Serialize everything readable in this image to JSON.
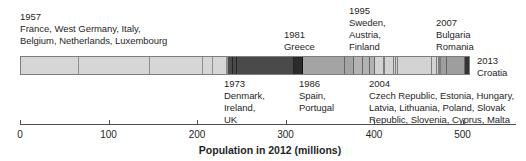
{
  "figure": {
    "background": "#ffffff",
    "text_color": "#1f1f1f",
    "axis_color": "#4d4d4d",
    "bar_border_color": "#7d7d7d"
  },
  "chart_data": {
    "type": "bar",
    "subtype": "stacked-timeline",
    "xlabel": "Population in 2012 (millions)",
    "axis": {
      "min": 0,
      "max": 500,
      "ticks": [
        0,
        100,
        200,
        300,
        400,
        500
      ],
      "unit": "millions",
      "grid": false
    },
    "groups": [
      {
        "year": "1957",
        "label_side": "above",
        "label_lines": [
          "1957",
          "France, West Germany, Italy,",
          "Belgium, Netherlands, Luxembourg"
        ],
        "fill": "#d6d6d6",
        "divider": "#8f8f8f",
        "countries": [
          {
            "name": "France",
            "population": 65.3
          },
          {
            "name": "West Germany",
            "population": 80.4
          },
          {
            "name": "Italy",
            "population": 59.7
          },
          {
            "name": "Belgium",
            "population": 11.1
          },
          {
            "name": "Netherlands",
            "population": 16.8
          },
          {
            "name": "Luxembourg",
            "population": 0.5
          }
        ]
      },
      {
        "year": "1973",
        "label_side": "below",
        "label_lines": [
          "1973",
          "Denmark,",
          "Ireland,",
          "UK"
        ],
        "fill": "#4a4a4a",
        "divider": "#242424",
        "countries": [
          {
            "name": "Denmark",
            "population": 5.6
          },
          {
            "name": "Ireland",
            "population": 4.6
          },
          {
            "name": "UK",
            "population": 63.5
          }
        ]
      },
      {
        "year": "1981",
        "label_side": "above",
        "label_lines": [
          "1981",
          "Greece"
        ],
        "fill": "#2b2b2b",
        "divider": "#111111",
        "countries": [
          {
            "name": "Greece",
            "population": 11.1
          }
        ]
      },
      {
        "year": "1986",
        "label_side": "below",
        "label_lines": [
          "1986",
          "Spain,",
          "Portugal"
        ],
        "fill": "#a4a4a4",
        "divider": "#666666",
        "countries": [
          {
            "name": "Spain",
            "population": 46.8
          },
          {
            "name": "Portugal",
            "population": 10.5
          }
        ]
      },
      {
        "year": "1995",
        "label_side": "above",
        "label_lines": [
          "1995",
          "Sweden,",
          "Austria,",
          "Finland"
        ],
        "fill": "#b2b2b2",
        "divider": "#666666",
        "countries": [
          {
            "name": "Sweden",
            "population": 9.5
          },
          {
            "name": "Austria",
            "population": 8.4
          },
          {
            "name": "Finland",
            "population": 5.4
          }
        ]
      },
      {
        "year": "2004",
        "label_side": "below",
        "label_lines": [
          "2004",
          "Czech Republic, Estonia, Hungary,",
          "Latvia, Lithuania, Poland, Slovak",
          "Republic, Slovenia, Cyprus, Malta"
        ],
        "fill": "#d3d3d3",
        "divider": "#7d7d7d",
        "countries": [
          {
            "name": "Czech Republic",
            "population": 10.5
          },
          {
            "name": "Estonia",
            "population": 1.3
          },
          {
            "name": "Hungary",
            "population": 9.9
          },
          {
            "name": "Latvia",
            "population": 2.0
          },
          {
            "name": "Lithuania",
            "population": 3.0
          },
          {
            "name": "Poland",
            "population": 38.5
          },
          {
            "name": "Slovak Republic",
            "population": 5.4
          },
          {
            "name": "Slovenia",
            "population": 2.1
          },
          {
            "name": "Cyprus",
            "population": 0.9
          },
          {
            "name": "Malta",
            "population": 0.4
          }
        ]
      },
      {
        "year": "2007",
        "label_side": "above",
        "label_lines": [
          "2007",
          "Bulgaria",
          "Romania"
        ],
        "fill": "#9e9e9e",
        "divider": "#666666",
        "countries": [
          {
            "name": "Bulgaria",
            "population": 7.3
          },
          {
            "name": "Romania",
            "population": 20.1
          }
        ]
      },
      {
        "year": "2013",
        "label_side": "right",
        "label_lines": [
          "2013",
          "Croatia"
        ],
        "fill": "#333333",
        "divider": "#111111",
        "countries": [
          {
            "name": "Croatia",
            "population": 4.3
          }
        ]
      }
    ]
  }
}
